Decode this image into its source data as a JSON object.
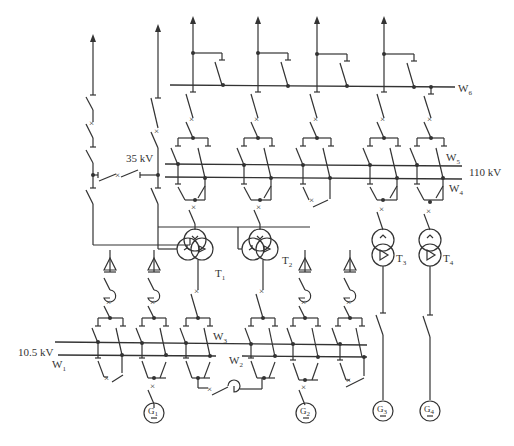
{
  "diagram": {
    "type": "single-line electrical main wiring diagram",
    "voltage_labels": {
      "high": "110 kV",
      "medium": "35 kV",
      "low": "10.5 kV"
    },
    "buses": [
      {
        "id": "W",
        "sub": "1",
        "voltage": "10.5 kV"
      },
      {
        "id": "W",
        "sub": "2",
        "voltage": "10.5 kV"
      },
      {
        "id": "W",
        "sub": "3",
        "voltage": "10.5 kV"
      },
      {
        "id": "W",
        "sub": "4",
        "voltage": "110 kV"
      },
      {
        "id": "W",
        "sub": "5",
        "voltage": "110 kV"
      },
      {
        "id": "W",
        "sub": "6",
        "voltage": "110 kV bypass"
      }
    ],
    "transformers": [
      {
        "id": "T",
        "sub": "1",
        "kind": "three-winding"
      },
      {
        "id": "T",
        "sub": "2",
        "kind": "three-winding"
      },
      {
        "id": "T",
        "sub": "3",
        "kind": "two-winding"
      },
      {
        "id": "T",
        "sub": "4",
        "kind": "two-winding"
      }
    ],
    "generators": [
      {
        "id": "G",
        "sub": "1"
      },
      {
        "id": "G",
        "sub": "2"
      },
      {
        "id": "G",
        "sub": "3"
      },
      {
        "id": "G",
        "sub": "4"
      }
    ]
  }
}
